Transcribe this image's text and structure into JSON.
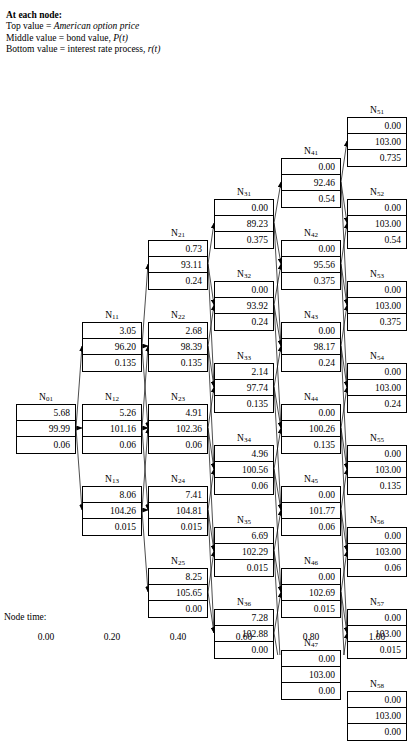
{
  "legend": {
    "title": "At each node:",
    "line1_pre": "Top value = ",
    "line1_em": "American option price",
    "line2_pre": "Middle value = bond value, ",
    "line2_em": "P(t)",
    "line3_pre": "Bottom value = interest rate process, ",
    "line3_em": "r(t)"
  },
  "axis": {
    "label": "Node time:",
    "ticks": [
      "0.00",
      "0.20",
      "0.40",
      "0.60",
      "0.80",
      "1.00"
    ]
  },
  "chart_data": {
    "type": "diagram",
    "row_meaning": [
      "American option price",
      "bond value P(t)",
      "interest rate process r(t)"
    ],
    "xlabel": "Node time:",
    "x": [
      0.0,
      0.2,
      0.4,
      0.6,
      0.8,
      1.0
    ],
    "columns": [
      {
        "time": "0.00",
        "nodes": [
          {
            "id": "N",
            "sub": "01",
            "option": "5.68",
            "bond": "99.99",
            "rate": "0.06"
          }
        ]
      },
      {
        "time": "0.20",
        "nodes": [
          {
            "id": "N",
            "sub": "11",
            "option": "3.05",
            "bond": "96.20",
            "rate": "0.135"
          },
          {
            "id": "N",
            "sub": "12",
            "option": "5.26",
            "bond": "101.16",
            "rate": "0.06"
          },
          {
            "id": "N",
            "sub": "13",
            "option": "8.06",
            "bond": "104.26",
            "rate": "0.015"
          }
        ]
      },
      {
        "time": "0.40",
        "nodes": [
          {
            "id": "N",
            "sub": "21",
            "option": "0.73",
            "bond": "93.11",
            "rate": "0.24"
          },
          {
            "id": "N",
            "sub": "22",
            "option": "2.68",
            "bond": "98.39",
            "rate": "0.135"
          },
          {
            "id": "N",
            "sub": "23",
            "option": "4.91",
            "bond": "102.36",
            "rate": "0.06"
          },
          {
            "id": "N",
            "sub": "24",
            "option": "7.41",
            "bond": "104.81",
            "rate": "0.015"
          },
          {
            "id": "N",
            "sub": "25",
            "option": "8.25",
            "bond": "105.65",
            "rate": "0.00"
          }
        ]
      },
      {
        "time": "0.60",
        "nodes": [
          {
            "id": "N",
            "sub": "31",
            "option": "0.00",
            "bond": "89.23",
            "rate": "0.375"
          },
          {
            "id": "N",
            "sub": "32",
            "option": "0.00",
            "bond": "93.92",
            "rate": "0.24"
          },
          {
            "id": "N",
            "sub": "33",
            "option": "2.14",
            "bond": "97.74",
            "rate": "0.135"
          },
          {
            "id": "N",
            "sub": "34",
            "option": "4.96",
            "bond": "100.56",
            "rate": "0.06"
          },
          {
            "id": "N",
            "sub": "35",
            "option": "6.69",
            "bond": "102.29",
            "rate": "0.015"
          },
          {
            "id": "N",
            "sub": "36",
            "option": "7.28",
            "bond": "102.88",
            "rate": "0.00"
          }
        ]
      },
      {
        "time": "0.80",
        "nodes": [
          {
            "id": "N",
            "sub": "41",
            "option": "0.00",
            "bond": "92.46",
            "rate": "0.54"
          },
          {
            "id": "N",
            "sub": "42",
            "option": "0.00",
            "bond": "95.56",
            "rate": "0.375"
          },
          {
            "id": "N",
            "sub": "43",
            "option": "0.00",
            "bond": "98.17",
            "rate": "0.24"
          },
          {
            "id": "N",
            "sub": "44",
            "option": "0.00",
            "bond": "100.26",
            "rate": "0.135"
          },
          {
            "id": "N",
            "sub": "45",
            "option": "0.00",
            "bond": "101.77",
            "rate": "0.06"
          },
          {
            "id": "N",
            "sub": "46",
            "option": "0.00",
            "bond": "102.69",
            "rate": "0.015"
          },
          {
            "id": "N",
            "sub": "47",
            "option": "0.00",
            "bond": "103.00",
            "rate": "0.00"
          }
        ]
      },
      {
        "time": "1.00",
        "nodes": [
          {
            "id": "N",
            "sub": "51",
            "option": "0.00",
            "bond": "103.00",
            "rate": "0.735"
          },
          {
            "id": "N",
            "sub": "52",
            "option": "0.00",
            "bond": "103.00",
            "rate": "0.54"
          },
          {
            "id": "N",
            "sub": "53",
            "option": "0.00",
            "bond": "103.00",
            "rate": "0.375"
          },
          {
            "id": "N",
            "sub": "54",
            "option": "0.00",
            "bond": "103.00",
            "rate": "0.24"
          },
          {
            "id": "N",
            "sub": "55",
            "option": "0.00",
            "bond": "103.00",
            "rate": "0.135"
          },
          {
            "id": "N",
            "sub": "56",
            "option": "0.00",
            "bond": "103.00",
            "rate": "0.06"
          },
          {
            "id": "N",
            "sub": "57",
            "option": "0.00",
            "bond": "103.00",
            "rate": "0.015"
          },
          {
            "id": "N",
            "sub": "58",
            "option": "0.00",
            "bond": "103.00",
            "rate": "0.00"
          }
        ]
      }
    ]
  }
}
